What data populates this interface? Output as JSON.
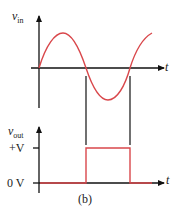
{
  "figure": {
    "caption": "(b)",
    "top_plot": {
      "y_label_main": "v",
      "y_label_sub": "in",
      "x_label": "t",
      "signal": "sine",
      "color": "#d9474b"
    },
    "bottom_plot": {
      "y_label_main": "v",
      "y_label_sub": "out",
      "x_label": "t",
      "ticks": [
        "+V",
        "0 V"
      ],
      "signal": "pulse",
      "color": "#d9474b"
    }
  }
}
